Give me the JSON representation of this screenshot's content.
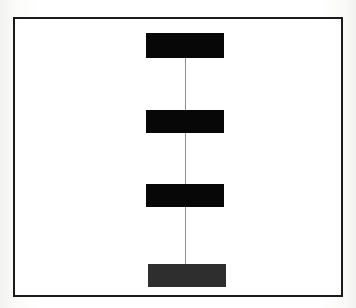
{
  "figure": {
    "title": "",
    "canvas": {
      "width": 356,
      "height": 308
    },
    "background_color": "#fcfcfb",
    "frame": {
      "name": "outer frame",
      "border_color": "#1b1b1b",
      "fill_color": "#ffffff",
      "border_width": 2
    },
    "connector": {
      "name": "vertical connector line",
      "color": "#8d8d8d",
      "width": 1,
      "orientation": "vertical"
    }
  },
  "diagram_data": {
    "type": "node-chain",
    "orientation": "vertical",
    "node_count": 4,
    "nodes": [
      {
        "id": "node-1",
        "label": "",
        "shape": "rectangle",
        "color": "#070707",
        "x": 146,
        "y": 33,
        "width": 78,
        "height": 25
      },
      {
        "id": "node-2",
        "label": "",
        "shape": "rectangle",
        "color": "#070707",
        "x": 146,
        "y": 110,
        "width": 78,
        "height": 23
      },
      {
        "id": "node-3",
        "label": "",
        "shape": "rectangle",
        "color": "#070707",
        "x": 146,
        "y": 184,
        "width": 78,
        "height": 23
      },
      {
        "id": "node-4",
        "label": "",
        "shape": "rectangle",
        "color": "#2e2e2e",
        "x": 148,
        "y": 264,
        "width": 78,
        "height": 23
      }
    ],
    "edges": [
      {
        "from": "node-1",
        "to": "node-2",
        "style": "solid",
        "color": "#8d8d8d"
      },
      {
        "from": "node-2",
        "to": "node-3",
        "style": "solid",
        "color": "#8d8d8d"
      },
      {
        "from": "node-3",
        "to": "node-4",
        "style": "solid",
        "color": "#8d8d8d"
      }
    ],
    "annotations": [],
    "legend": []
  }
}
